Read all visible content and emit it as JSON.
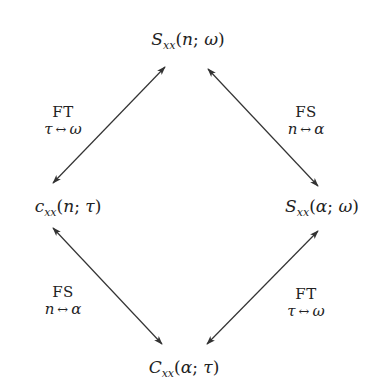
{
  "diagram": {
    "type": "commutative-diagram",
    "nodes": {
      "top": {
        "symbol": "S",
        "subscript": "xx",
        "arg1": "n",
        "sep": ";",
        "arg2": "ω"
      },
      "left": {
        "symbol": "c",
        "subscript": "xx",
        "arg1": "n",
        "sep": ";",
        "arg2": "τ"
      },
      "right": {
        "symbol": "S",
        "subscript": "xx",
        "arg1": "α",
        "sep": ";",
        "arg2": "ω"
      },
      "bottom": {
        "symbol": "C",
        "subscript": "xx",
        "arg1": "α",
        "sep": ";",
        "arg2": "τ"
      }
    },
    "edges": {
      "top_left": {
        "op": "FT",
        "from": "τ",
        "arrow": "↔",
        "to": "ω"
      },
      "top_right": {
        "op": "FS",
        "from": "n",
        "arrow": "↔",
        "to": "α"
      },
      "bottom_left": {
        "op": "FS",
        "from": "n",
        "arrow": "↔",
        "to": "α"
      },
      "bottom_right": {
        "op": "FT",
        "from": "τ",
        "arrow": "↔",
        "to": "ω"
      }
    },
    "colors": {
      "text": "#222222",
      "line": "#333333",
      "background": "#ffffff"
    }
  }
}
